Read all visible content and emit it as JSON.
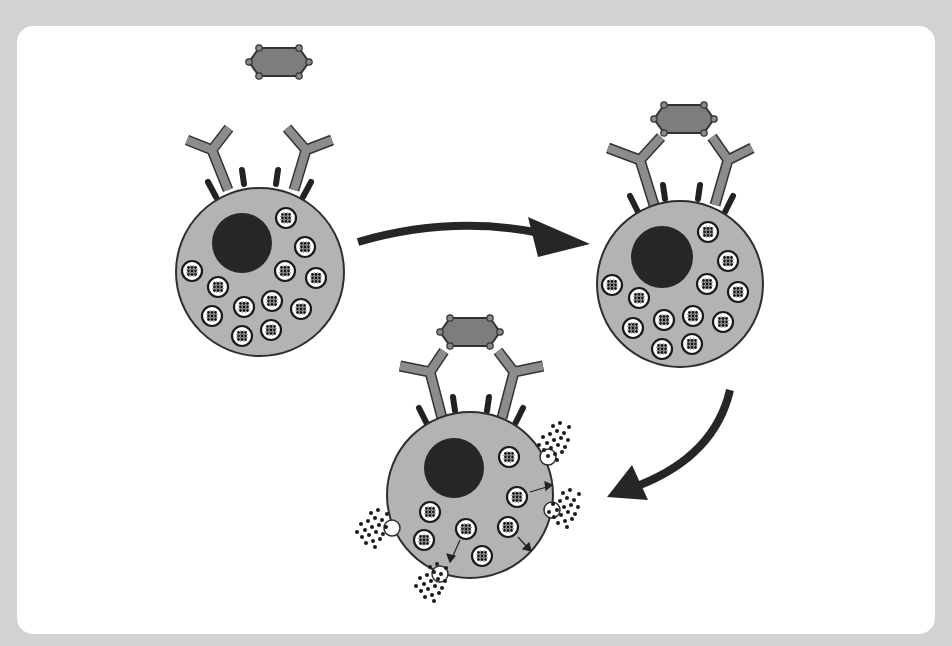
{
  "diagram": {
    "title": "",
    "type": "mast-cell-degranulation",
    "colors": {
      "background": "#d2d2d2",
      "panel": "#ffffff",
      "cell_fill": "#b3b3b3",
      "cell_stroke": "#3a3a3a",
      "nucleus": "#262626",
      "antibody": "#8c8c8c",
      "antigen": "#7d7d7d",
      "receptor": "#222222",
      "arrow": "#262626",
      "granule_fill": "#ffffff",
      "granule_dot": "#1a1a1a"
    },
    "stages": [
      {
        "id": "stage-1",
        "label": "",
        "description": "Free antigen above mast cell with unbound IgE antibodies",
        "granule_count": 12
      },
      {
        "id": "stage-2",
        "label": "",
        "description": "Antigen crosslinks two IgE antibodies on mast cell",
        "granule_count": 12
      },
      {
        "id": "stage-3",
        "label": "",
        "description": "Degranulation: granules fuse with membrane and release mediators",
        "granule_count": 8,
        "release_sites": 4
      }
    ],
    "arrows": [
      {
        "from": "stage-1",
        "to": "stage-2",
        "direction": "right"
      },
      {
        "from": "stage-2",
        "to": "stage-3",
        "direction": "down-left"
      }
    ]
  }
}
